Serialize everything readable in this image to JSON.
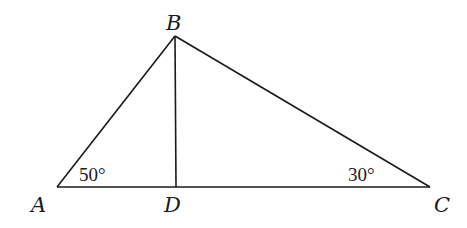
{
  "diagram": {
    "type": "triangle-with-altitude",
    "vertices": {
      "A": {
        "label": "A",
        "x": 57,
        "y": 187
      },
      "B": {
        "label": "B",
        "x": 175,
        "y": 36
      },
      "C": {
        "label": "C",
        "x": 430,
        "y": 187
      },
      "D": {
        "label": "D",
        "x": 176,
        "y": 187
      }
    },
    "segments": [
      "AB",
      "BC",
      "AC",
      "BD"
    ],
    "angles": {
      "A": {
        "label": "50°"
      },
      "C": {
        "label": "30°"
      }
    }
  }
}
